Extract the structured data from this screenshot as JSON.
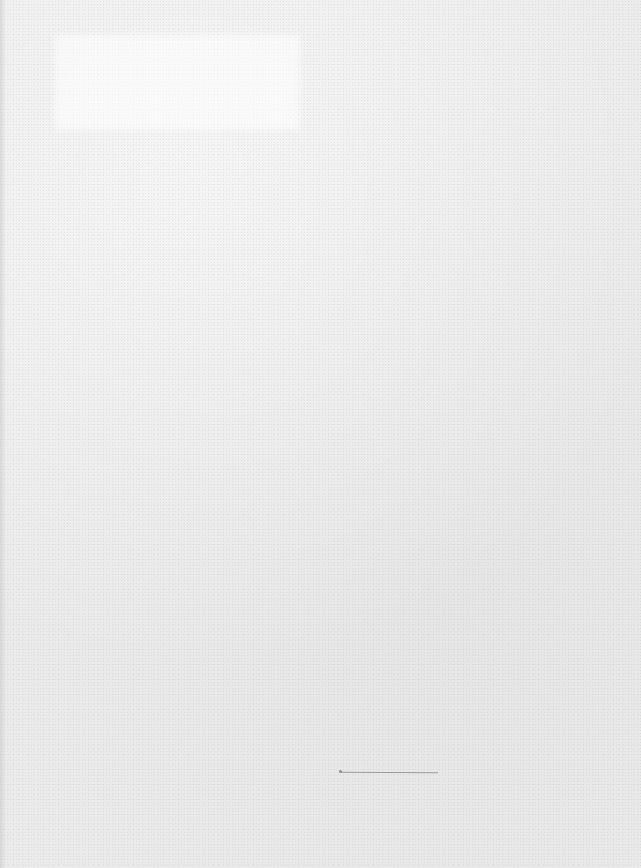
{
  "document": {
    "type": "blank scanned page",
    "text_blocks": [],
    "marks": [
      {
        "kind": "signature-line",
        "color": "#9a9a9a"
      }
    ]
  },
  "colors": {
    "paper": "#ececec",
    "mark": "#9a9a9a"
  }
}
